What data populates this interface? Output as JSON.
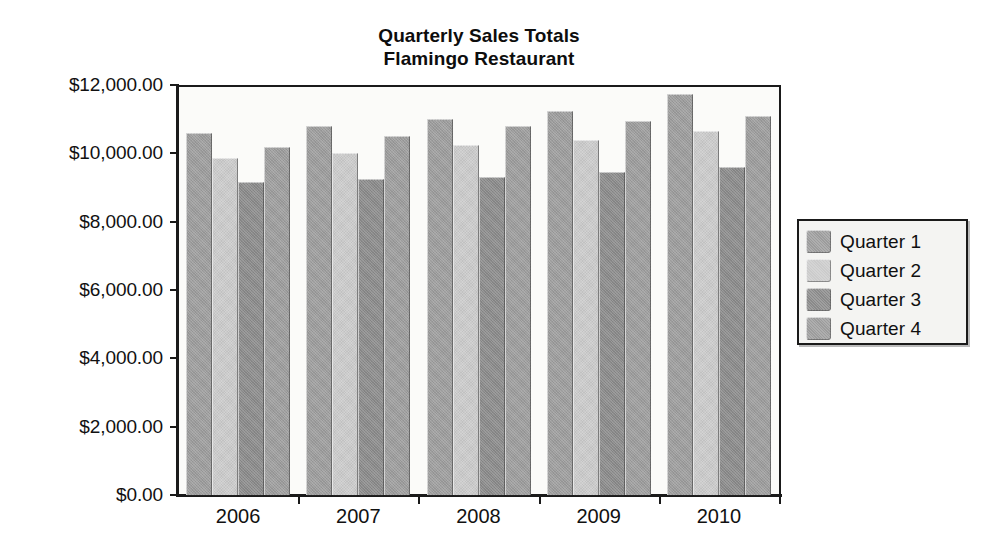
{
  "chart_data": {
    "type": "bar",
    "title": "Quarterly Sales Totals",
    "subtitle": "Flamingo Restaurant",
    "title_lines": [
      "Quarterly Sales Totals",
      "Flamingo Restaurant"
    ],
    "xlabel": "",
    "ylabel": "",
    "categories": [
      "2006",
      "2007",
      "2008",
      "2009",
      "2010"
    ],
    "series": [
      {
        "name": "Quarter 1",
        "color": "#9c9c9c",
        "values": [
          10600,
          10800,
          11000,
          11250,
          11750
        ]
      },
      {
        "name": "Quarter 2",
        "color": "#cbcbcb",
        "values": [
          9850,
          10000,
          10250,
          10400,
          10650
        ]
      },
      {
        "name": "Quarter 3",
        "color": "#8a8a8a",
        "values": [
          9150,
          9250,
          9300,
          9450,
          9600
        ]
      },
      {
        "name": "Quarter 4",
        "color": "#9c9c9c",
        "values": [
          10200,
          10500,
          10800,
          10950,
          11100
        ]
      }
    ],
    "ylim": [
      0,
      12000
    ],
    "ytick_values": [
      0,
      2000,
      4000,
      6000,
      8000,
      10000,
      12000
    ],
    "ytick_labels": [
      "$0.00",
      "$2,000.00",
      "$4,000.00",
      "$6,000.00",
      "$8,000.00",
      "$10,000.00",
      "$12,000.00"
    ],
    "grid": false,
    "legend_position": "right",
    "legend_entries": [
      "Quarter 1",
      "Quarter 2",
      "Quarter 3",
      "Quarter 4"
    ],
    "colors": {
      "axis": "#1a1a1a",
      "plot_background": "#fbfbf9",
      "figure_background": "#ffffff",
      "text": "#111111"
    }
  }
}
